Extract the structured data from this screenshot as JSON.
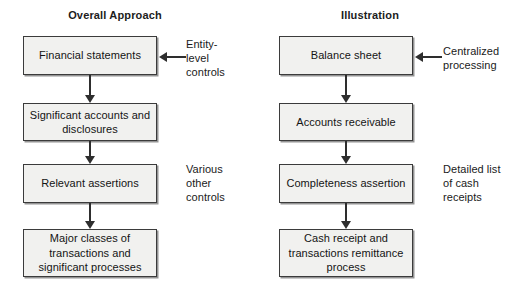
{
  "diagram": {
    "colors": {
      "box_fill": "#f1f1ef",
      "box_border": "#3b3b3b",
      "arrow": "#2e2e2e",
      "text": "#141414",
      "background": "#ffffff"
    },
    "columns": [
      {
        "id": "overall-approach",
        "header": "Overall Approach",
        "nodes": [
          {
            "id": "financial-statements",
            "text": "Financial\nstatements"
          },
          {
            "id": "significant-accounts",
            "text": "Significant accounts\nand disclosures"
          },
          {
            "id": "relevant-assertions",
            "text": "Relevant\nassertions"
          },
          {
            "id": "major-classes",
            "text": "Major classes of\ntransactions and\nsignificant processes"
          }
        ],
        "notes": [
          {
            "id": "entity-level-controls",
            "text": "Entity-\nlevel\ncontrols",
            "has_arrow": true
          },
          {
            "id": "various-other-controls",
            "text": "Various\nother\ncontrols",
            "has_arrow": false
          }
        ]
      },
      {
        "id": "illustration",
        "header": "Illustration",
        "nodes": [
          {
            "id": "balance-sheet",
            "text": "Balance\nsheet"
          },
          {
            "id": "accounts-receivable",
            "text": "Accounts\nreceivable"
          },
          {
            "id": "completeness-assertion",
            "text": "Completeness\nassertion"
          },
          {
            "id": "cash-receipt",
            "text": "Cash receipt and\ntransactions remittance\nprocess"
          }
        ],
        "notes": [
          {
            "id": "centralized-processing",
            "text": "Centralized\nprocessing",
            "has_arrow": true
          },
          {
            "id": "detailed-list",
            "text": "Detailed list\nof cash\nreceipts",
            "has_arrow": false
          }
        ]
      }
    ]
  }
}
